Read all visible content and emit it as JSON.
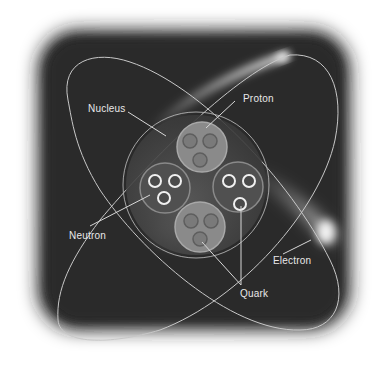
{
  "diagram": {
    "labels": {
      "nucleus": "Nucleus",
      "proton": "Proton",
      "neutron": "Neutron",
      "electron": "Electron",
      "quark": "Quark"
    },
    "colors": {
      "background_dark": "#2e2e2e",
      "orbit": "#c8c8c8",
      "nucleus_fill": "#4a4a4a",
      "proton_fill": "#8a8a8a",
      "neutron_fill": "#555555",
      "quark_ring_bright": "#f0f0f0",
      "quark_ring_dim": "#6e6e6e",
      "label_text": "#e8e8e8"
    },
    "particles": {
      "protons": 2,
      "neutrons": 2,
      "quarks_per_nucleon": 3
    }
  }
}
